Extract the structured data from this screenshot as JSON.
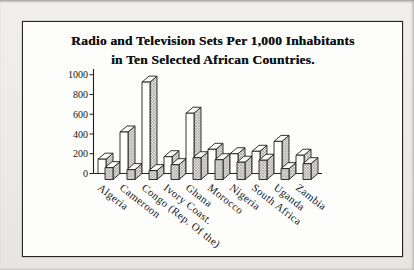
{
  "page": {
    "background": "#ecebe7",
    "frame_border_color": "#262626",
    "ink_color": "#1d1d1d"
  },
  "title": {
    "line1": "Radio and Television Sets Per 1,000 Inhabitants",
    "line2": "in Ten Selected African Countries."
  },
  "chart_data": {
    "type": "bar",
    "style_3d": true,
    "title": "Radio and Television Sets Per 1,000 Inhabitants in Ten Selected African Countries.",
    "categories": [
      "Algeria",
      "Cameroon",
      "Congo (Rep. Of the)",
      "Ivory Coast.",
      "Ghana",
      "Morocco",
      "Nigeria",
      "South Africa",
      "Uganda",
      "Zambia"
    ],
    "series": [
      {
        "name": "Radio",
        "style": "white",
        "values": [
          145,
          420,
          925,
          170,
          610,
          245,
          200,
          225,
          325,
          185
        ]
      },
      {
        "name": "Television",
        "style": "hatched",
        "values": [
          120,
          100,
          90,
          150,
          220,
          200,
          175,
          195,
          110,
          160
        ]
      }
    ],
    "xlabel": "",
    "ylabel": "",
    "ylim": [
      0,
      1000
    ],
    "yticks": [
      0,
      200,
      400,
      600,
      800,
      1000
    ],
    "grid": false,
    "legend_position": "none"
  }
}
